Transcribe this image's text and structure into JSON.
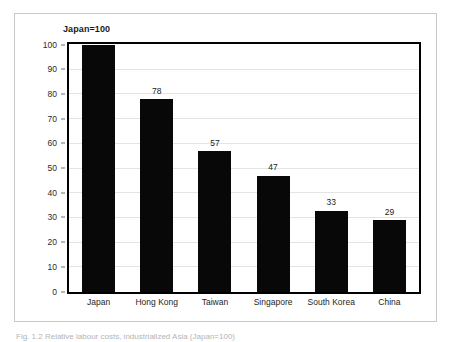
{
  "figure": {
    "caption": "Fig. 1.2  Relative labour costs, industrialized Asia (Japan=100)"
  },
  "chart_data": {
    "type": "bar",
    "title": "Japan=100",
    "xlabel": "",
    "ylabel": "",
    "categories": [
      "Japan",
      "Hong Kong",
      "Taiwan",
      "Singapore",
      "South Korea",
      "China"
    ],
    "values": [
      100,
      78,
      57,
      47,
      33,
      29
    ],
    "value_labels": [
      "",
      "78",
      "57",
      "47",
      "33",
      "29"
    ],
    "ylim": [
      0,
      100
    ],
    "yticks": [
      0,
      10,
      20,
      30,
      40,
      50,
      60,
      70,
      80,
      90,
      100
    ],
    "ytick_labels": [
      "0",
      "10",
      "20",
      "30",
      "40",
      "50",
      "60",
      "70",
      "80",
      "90",
      "100"
    ],
    "grid": true,
    "legend": false,
    "bar_color": "#080808",
    "gridline_color": "#e4e4e4",
    "frame_color": "#000000"
  }
}
